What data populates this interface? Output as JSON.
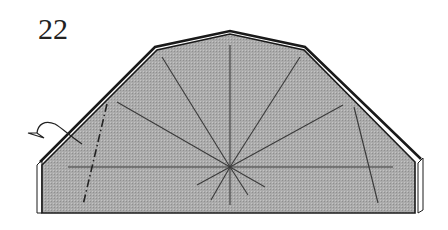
{
  "diagram": {
    "step_number": "22",
    "type": "origami fold diagram",
    "colors": {
      "paper_fill": "#a9a9a9",
      "outline": "#1a1a1a",
      "crease": "#3a3a3a",
      "flap_edge": "#ffffff"
    },
    "elements": [
      "folded paper shape (gray, outlined)",
      "radial crease lines from center point",
      "horizontal crease line",
      "dash-dot valley fold line (left)",
      "diagonal crease (right)",
      "curved fold arrow (left)",
      "white layer edges on left and right sides"
    ]
  }
}
